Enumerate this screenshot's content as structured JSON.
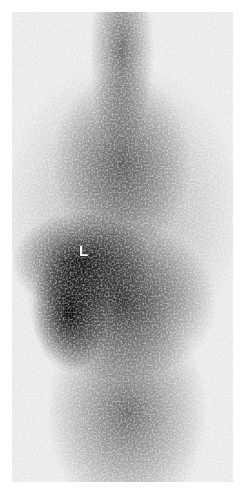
{
  "image": {
    "type": "scintigraphy-grayscale",
    "annotations": [
      {
        "text": "L"
      }
    ]
  }
}
